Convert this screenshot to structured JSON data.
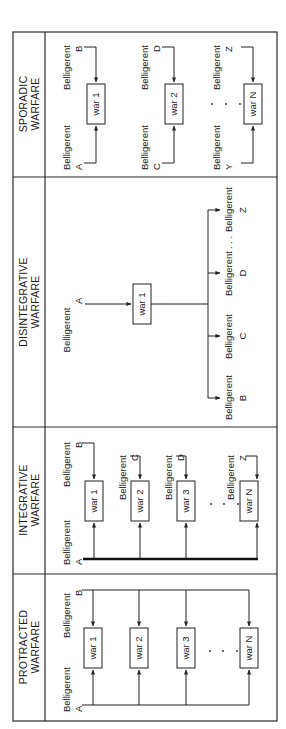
{
  "sections": [
    {
      "id": "sporadic",
      "title_line1": "SPORADIC",
      "title_line2": "WARFARE",
      "rows": [
        {
          "war": "war 1",
          "left_label": "Belligerent",
          "left_letter": "A",
          "right_label": "Belligerent",
          "right_letter": "B"
        },
        {
          "war": "war 2",
          "left_label": "Belligerent",
          "left_letter": "C",
          "right_label": "Belligerent",
          "right_letter": "D"
        },
        {
          "war": "war N",
          "left_label": "Belligerent",
          "left_letter": "Y",
          "right_label": "Belligerent",
          "right_letter": "Z"
        }
      ],
      "ellipsis": ". . ."
    },
    {
      "id": "disintegrative",
      "title_line1": "DISINTEGRATIVE",
      "title_line2": "WARFARE",
      "source": {
        "label": "Belligerent",
        "letter": "A"
      },
      "war": "war 1",
      "targets": [
        {
          "label": "Belligerent",
          "letter": "B"
        },
        {
          "label": "Belligerent",
          "letter": "C"
        },
        {
          "label": "Belligerent",
          "letter": "D"
        },
        {
          "label": "Belligerent",
          "letter": "Z"
        }
      ],
      "ellipsis": ". . ."
    },
    {
      "id": "integrative",
      "title_line1": "INTEGRATIVE",
      "title_line2": "WARFARE",
      "common": {
        "label": "Belligerent",
        "letter": "A"
      },
      "wars": [
        {
          "war": "war 1",
          "label": "Belligerent",
          "letter": "B"
        },
        {
          "war": "war 2",
          "label": "Belligerent",
          "letter": "C"
        },
        {
          "war": "war 3",
          "label": "Belligerent",
          "letter": "D"
        },
        {
          "war": "war N",
          "label": "Belligerent",
          "letter": "Z"
        }
      ],
      "ellipsis": ". . ."
    },
    {
      "id": "protracted",
      "title_line1": "PROTRACTED",
      "title_line2": "WARFARE",
      "side_a": {
        "label": "Belligerent",
        "letter": "A"
      },
      "side_b": {
        "label": "Belligerent",
        "letter": "B"
      },
      "wars": [
        "war 1",
        "war 2",
        "war 3",
        "war N"
      ],
      "ellipsis": ". . ."
    }
  ]
}
